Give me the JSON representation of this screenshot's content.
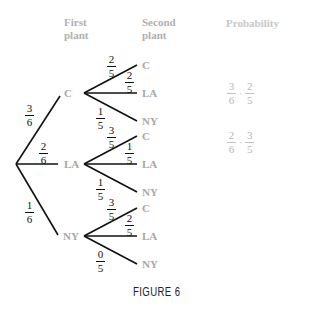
{
  "headers": {
    "first_plant": [
      "First",
      "plant"
    ],
    "second_plant": [
      "Second",
      "plant"
    ],
    "probability": "Probability"
  },
  "root_branches": [
    {
      "label": "C",
      "prob": {
        "num": "3",
        "den": "6"
      }
    },
    {
      "label": "LA",
      "prob": {
        "num": "2",
        "den": "6"
      }
    },
    {
      "label": "NY",
      "prob": {
        "num": "1",
        "den": "6"
      }
    }
  ],
  "second_branches": {
    "C": [
      {
        "label": "C",
        "prob": {
          "num": "2",
          "den": "5"
        }
      },
      {
        "label": "LA",
        "prob": {
          "num": "2",
          "den": "5"
        }
      },
      {
        "label": "NY",
        "prob": {
          "num": "1",
          "den": "5"
        }
      }
    ],
    "LA": [
      {
        "label": "C",
        "prob": {
          "num": "3",
          "den": "5"
        }
      },
      {
        "label": "LA",
        "prob": {
          "num": "1",
          "den": "5"
        }
      },
      {
        "label": "NY",
        "prob": {
          "num": "1",
          "den": "5"
        }
      }
    ],
    "NY": [
      {
        "label": "C",
        "prob": {
          "num": "3",
          "den": "5"
        }
      },
      {
        "label": "LA",
        "prob": {
          "num": "2",
          "den": "5"
        }
      },
      {
        "label": "NY",
        "prob": {
          "num": "0",
          "den": "5"
        }
      }
    ]
  },
  "probabilities": [
    {
      "a": {
        "num": "3",
        "den": "6"
      },
      "op": "·",
      "b": {
        "num": "2",
        "den": "5"
      }
    },
    {
      "a": {
        "num": "2",
        "den": "6"
      },
      "op": "·",
      "b": {
        "num": "3",
        "den": "5"
      }
    }
  ],
  "caption": "FIGURE 6"
}
